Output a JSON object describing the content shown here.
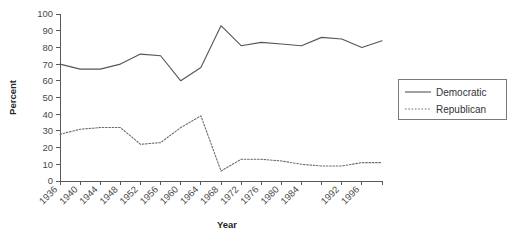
{
  "chart_data": {
    "type": "line",
    "title": "",
    "xlabel": "Year",
    "ylabel": "Percent",
    "ylim": [
      0,
      100
    ],
    "ytick_step": 10,
    "yticks": [
      0,
      10,
      20,
      30,
      40,
      50,
      60,
      70,
      80,
      90,
      100
    ],
    "grid": false,
    "legend_position": "right",
    "categories": [
      1936,
      1940,
      1944,
      1948,
      1952,
      1956,
      1960,
      1964,
      1968,
      1972,
      1976,
      1980,
      1984,
      1988,
      1992,
      1996,
      2000
    ],
    "xtick_labels": [
      "1936",
      "1940",
      "1944",
      "1948",
      "1952",
      "1956",
      "1960",
      "1964",
      "1968",
      "1972",
      "1976",
      "1980",
      "1984",
      "",
      "1992",
      "1996",
      ""
    ],
    "series": [
      {
        "name": "Democratic",
        "style": "solid",
        "color": "#55555a",
        "values": [
          70,
          67,
          67,
          70,
          76,
          75,
          60,
          68,
          93,
          81,
          83,
          82,
          81,
          86,
          85,
          80,
          84
        ]
      },
      {
        "name": "Republican",
        "style": "dotted",
        "color": "#6c6c70",
        "values": [
          28,
          31,
          32,
          32,
          22,
          23,
          32,
          39,
          6,
          13,
          13,
          12,
          10,
          9,
          9,
          11,
          11
        ]
      }
    ]
  },
  "legend": {
    "items": [
      {
        "label": "Democratic"
      },
      {
        "label": "Republican"
      }
    ]
  },
  "axes": {
    "x_title": "Year",
    "y_title": "Percent"
  }
}
